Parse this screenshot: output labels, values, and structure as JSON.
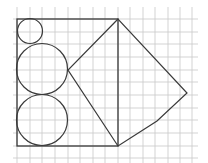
{
  "diagram": {
    "grid": {
      "color": "#c8c8c8",
      "spacing": 12.5,
      "x_lines": [
        17,
        30,
        42,
        55,
        68,
        80,
        93,
        105,
        118,
        130,
        143,
        155,
        168,
        180,
        192
      ],
      "y_lines": [
        19,
        32,
        44,
        57,
        70,
        82,
        95,
        108,
        120,
        133,
        146,
        158
      ]
    },
    "stroke_color": "#3a3a3a",
    "rectangle": {
      "x": 17,
      "y": 19,
      "width": 101,
      "height": 127
    },
    "circles": [
      {
        "name": "small-circle",
        "cx": 30,
        "cy": 31,
        "r": 12.5
      },
      {
        "name": "middle-circle",
        "cx": 42,
        "cy": 69,
        "r": 25.5
      },
      {
        "name": "bottom-circle",
        "cx": 42,
        "cy": 120,
        "r": 25.5
      }
    ],
    "polygon": {
      "name": "quadrilateral-right",
      "points": [
        [
          118,
          19
        ],
        [
          68,
          70
        ],
        [
          118,
          146
        ],
        [
          157,
          121
        ],
        [
          187,
          93
        ]
      ]
    }
  }
}
